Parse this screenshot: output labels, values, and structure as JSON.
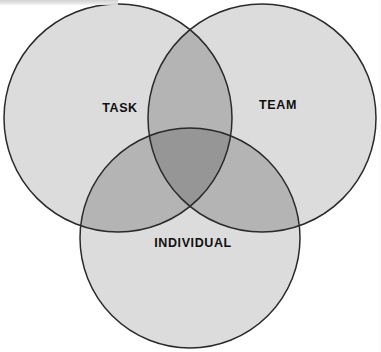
{
  "diagram": {
    "type": "venn",
    "title": "",
    "background_color": "#ffffff",
    "sets": [
      {
        "id": "task",
        "label": "TASK",
        "position": "top-left",
        "cx": 118,
        "cy": 118,
        "r": 114,
        "label_x": 120,
        "label_y": 109,
        "fill": "#dcdcdc",
        "stroke": "#2a2a2a"
      },
      {
        "id": "team",
        "label": "TEAM",
        "position": "top-right",
        "cx": 262,
        "cy": 118,
        "r": 114,
        "label_x": 278,
        "label_y": 106,
        "fill": "#dcdcdc",
        "stroke": "#2a2a2a"
      },
      {
        "id": "individual",
        "label": "INDIVIDUAL",
        "position": "bottom-center",
        "cx": 190,
        "cy": 238,
        "r": 110,
        "label_x": 193,
        "label_y": 244,
        "fill": "#dcdcdc",
        "stroke": "#2a2a2a"
      }
    ],
    "overlaps": {
      "pair_fill": "#b4b4b4",
      "triple_fill": "#969696",
      "pairs": [
        {
          "id": "task-team",
          "sets": [
            "task",
            "team"
          ]
        },
        {
          "id": "task-individual",
          "sets": [
            "task",
            "individual"
          ]
        },
        {
          "id": "team-individual",
          "sets": [
            "team",
            "individual"
          ]
        }
      ],
      "triple": {
        "id": "task-team-individual",
        "sets": [
          "task",
          "team",
          "individual"
        ]
      }
    },
    "colors": {
      "base_fill": "#dcdcdc",
      "pair_fill": "#b4b4b4",
      "triple_fill": "#969696",
      "outline": "#2a2a2a",
      "label_text": "#101010",
      "background": "#ffffff"
    },
    "stroke_width": 1.5
  }
}
